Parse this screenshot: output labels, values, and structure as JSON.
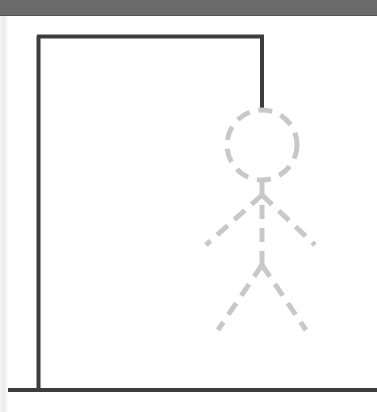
{
  "game": {
    "name": "Hangman",
    "wrong_guesses_shown": 0,
    "max_wrong_guesses": 6
  },
  "colors": {
    "top_bar": "#6b6b6b",
    "gallows": "#3d3d3d",
    "figure_placeholder": "#c8c8c8",
    "background": "#ffffff"
  },
  "figure_parts": [
    "head",
    "body",
    "left-arm",
    "right-arm",
    "left-leg",
    "right-leg"
  ]
}
